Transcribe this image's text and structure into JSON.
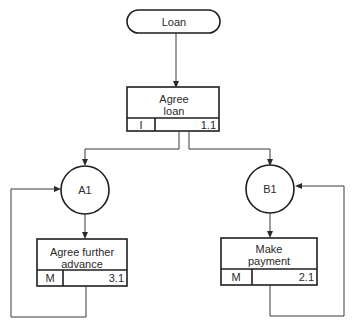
{
  "diagram": {
    "start": {
      "label": "Loan"
    },
    "root": {
      "title_line1": "Agree",
      "title_line2": "loan",
      "type": "I",
      "id": "1.1"
    },
    "nodes": [
      {
        "label": "A1"
      },
      {
        "label": "B1"
      }
    ],
    "tasks": [
      {
        "title_line1": "Agree further",
        "title_line2": "advance",
        "type": "M",
        "id": "3.1"
      },
      {
        "title_line1": "Make",
        "title_line2": "payment",
        "type": "M",
        "id": "2.1"
      }
    ],
    "colors": {
      "line": "#3a3a3a",
      "box_border": "#1e1e1e",
      "text": "#2a2a2a",
      "background": "#ffffff"
    }
  }
}
